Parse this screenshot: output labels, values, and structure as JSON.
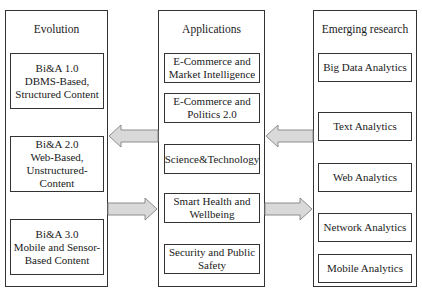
{
  "diagram": {
    "columns": [
      {
        "title": "Evolution",
        "items": [
          "Bi&A 1.0\nDBMS-Based,\nStructured Content",
          "Bi&A 2.0\nWeb-Based,\nUnstructured-Content",
          "Bi&A 3.0\nMobile and Sensor-\nBased Content"
        ]
      },
      {
        "title": "Applications",
        "items": [
          "E-Commerce and\nMarket Intelligence",
          "E-Commerce and\nPolitics 2.0",
          "Science&Technology",
          "Smart Health and\nWellbeing",
          "Security and Public\nSafety"
        ]
      },
      {
        "title": "Emerging research",
        "items": [
          "Big Data Analytics",
          "Text Analytics",
          "Web Analytics",
          "Network Analytics",
          "Mobile Analytics"
        ]
      }
    ],
    "arrows": [
      {
        "from": "Applications",
        "to": "Evolution",
        "direction": "left"
      },
      {
        "from": "Emerging research",
        "to": "Applications",
        "direction": "left"
      },
      {
        "from": "Evolution",
        "to": "Applications",
        "direction": "right"
      },
      {
        "from": "Applications",
        "to": "Emerging research",
        "direction": "right"
      }
    ],
    "colors": {
      "border": "#333333",
      "arrow_fill": "#d9d9d9",
      "arrow_stroke": "#8c8c8c"
    }
  }
}
